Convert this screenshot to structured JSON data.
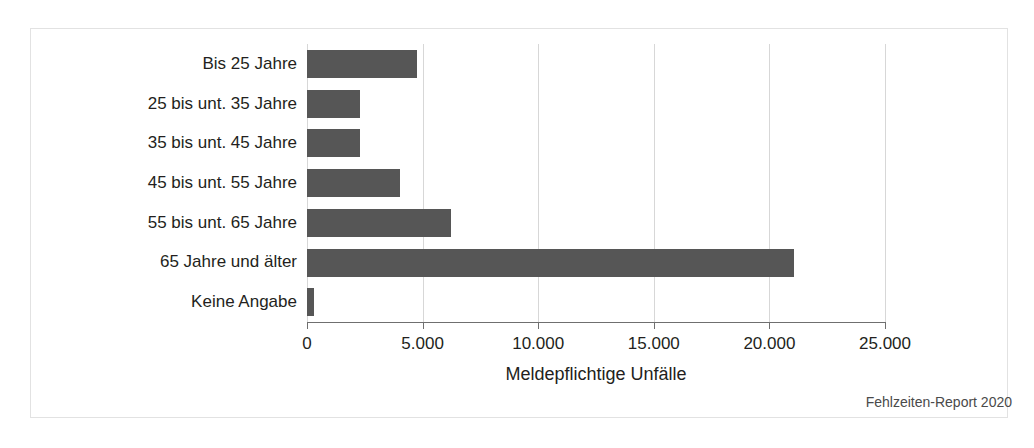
{
  "chart_data": {
    "type": "bar",
    "orientation": "horizontal",
    "title": "",
    "xlabel": "Meldepflichtige Unfälle",
    "ylabel": "",
    "categories": [
      "Bis 25 Jahre",
      "25 bis unt. 35 Jahre",
      "35 bis unt. 45 Jahre",
      "45 bis unt. 55 Jahre",
      "55 bis unt. 65 Jahre",
      "65 Jahre und älter",
      "Keine Angabe"
    ],
    "values": [
      4760,
      2290,
      2300,
      4030,
      6230,
      21080,
      300
    ],
    "xlim": [
      0,
      25000
    ],
    "xticks": [
      0,
      5000,
      10000,
      15000,
      20000,
      25000
    ],
    "xtick_labels": [
      "0",
      "5.000",
      "10.000",
      "15.000",
      "20.000",
      "25.000"
    ],
    "grid": true,
    "grid_axis": "x",
    "legend": false,
    "bar_color": "#565656",
    "grid_color": "#d7d7d7",
    "axis_color": "#6f6f6f",
    "background_color": "#ffffff"
  },
  "footer": {
    "source": "Fehlzeiten-Report 2020"
  }
}
